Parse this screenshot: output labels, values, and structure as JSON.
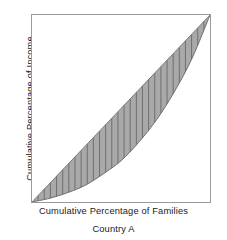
{
  "figure": {
    "caption": "Country A",
    "axes": {
      "x_label": "Cumulative Percentage of Families",
      "y_label": "Cumulative Percentage of Income"
    }
  },
  "colors": {
    "background": "#ffffff",
    "frame_border": "#9a9a9a",
    "band_fill": "#a9a9a9",
    "band_edge": "#6e6e6e",
    "hatch_line": "#6e6e6e",
    "text": "#1a1a1a"
  },
  "chart_data": {
    "type": "area",
    "title": "",
    "subtitle": "",
    "xlabel": "Cumulative Percentage of Families",
    "ylabel": "Cumulative Percentage of Income",
    "caption": "Country A",
    "xlim": [
      0,
      100
    ],
    "ylim": [
      0,
      100
    ],
    "grid": false,
    "legend": "none",
    "axis_ticks": {
      "x": [],
      "y": []
    },
    "annotations": [],
    "series": [
      {
        "name": "Line of Equality",
        "note": "45-degree diagonal from origin to upper-right corner",
        "x": [
          0,
          10,
          20,
          30,
          40,
          50,
          60,
          70,
          80,
          90,
          100
        ],
        "values": [
          0,
          10,
          20,
          30,
          40,
          50,
          60,
          70,
          80,
          90,
          100
        ]
      },
      {
        "name": "Lorenz Curve",
        "note": "bowed below the diagonal; shaded inequality gap between the two",
        "x": [
          0,
          10,
          20,
          30,
          40,
          50,
          60,
          70,
          80,
          90,
          100
        ],
        "values": [
          0,
          2,
          5,
          9,
          15,
          22,
          32,
          44,
          59,
          77,
          100
        ]
      }
    ],
    "shaded_region": {
      "name": "Area of inequality",
      "between": [
        "Line of Equality",
        "Lorenz Curve"
      ],
      "fill": "#a9a9a9",
      "hatch": "vertical",
      "hatch_count": 28
    }
  }
}
